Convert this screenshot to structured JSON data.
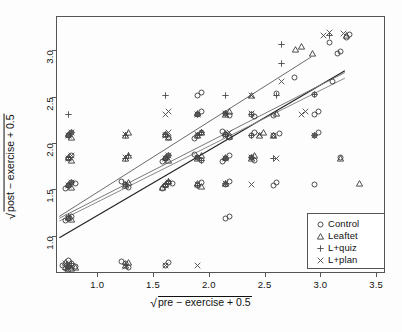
{
  "chart_data": {
    "type": "scatter",
    "title": "",
    "xlabel": "√pre − exercise + 0.5",
    "ylabel": "√post − exercise + 0.5",
    "xlim": [
      0.63,
      3.58
    ],
    "ylim": [
      0.6,
      3.37
    ],
    "xticks": [
      1.0,
      1.5,
      2.0,
      2.5,
      3.0,
      3.5
    ],
    "xtick_labels": [
      "1.0",
      "1.5",
      "2.0",
      "2.5",
      "3.0",
      "3.5"
    ],
    "yticks": [
      1.0,
      1.5,
      2.0,
      2.5,
      3.0
    ],
    "ytick_labels": [
      "1.0",
      "1.5",
      "2.0",
      "2.5",
      "3.0"
    ],
    "grid": false,
    "legend_position": "bottom-right",
    "legend": [
      {
        "label": "Control",
        "marker": "circle-marker",
        "glyph": "○"
      },
      {
        "label": "Leaftet",
        "marker": "triangle-marker",
        "glyph": "△"
      },
      {
        "label": "L+quiz",
        "marker": "plus-marker",
        "glyph": "+"
      },
      {
        "label": "L+plan",
        "marker": "cross-marker",
        "glyph": "×"
      }
    ],
    "series": [
      {
        "name": "Control",
        "marker": "circle-marker",
        "points": [
          [
            0.71,
            0.71
          ],
          [
            0.74,
            0.74
          ],
          [
            0.68,
            0.69
          ],
          [
            0.71,
            0.77
          ],
          [
            0.77,
            0.71
          ],
          [
            0.71,
            0.68
          ],
          [
            0.66,
            0.72
          ],
          [
            1.22,
            0.74
          ],
          [
            1.25,
            0.7
          ],
          [
            1.19,
            0.76
          ],
          [
            1.58,
            0.72
          ],
          [
            1.61,
            0.75
          ],
          [
            0.71,
            1.23
          ],
          [
            0.74,
            1.25
          ],
          [
            0.68,
            1.2
          ],
          [
            0.71,
            1.58
          ],
          [
            0.74,
            1.61
          ],
          [
            0.68,
            1.55
          ],
          [
            0.77,
            1.6
          ],
          [
            1.22,
            1.59
          ],
          [
            1.25,
            1.56
          ],
          [
            1.19,
            1.62
          ],
          [
            1.58,
            1.58
          ],
          [
            1.61,
            1.61
          ],
          [
            1.55,
            1.55
          ],
          [
            1.64,
            1.6
          ],
          [
            1.87,
            1.58
          ],
          [
            1.9,
            1.61
          ],
          [
            2.12,
            1.59
          ],
          [
            2.15,
            1.62
          ],
          [
            0.71,
            1.87
          ],
          [
            0.74,
            1.9
          ],
          [
            1.58,
            1.87
          ],
          [
            1.61,
            1.9
          ],
          [
            1.55,
            1.84
          ],
          [
            1.87,
            1.88
          ],
          [
            1.9,
            1.85
          ],
          [
            1.84,
            1.91
          ],
          [
            2.12,
            1.87
          ],
          [
            2.15,
            1.9
          ],
          [
            2.09,
            1.84
          ],
          [
            2.35,
            1.88
          ],
          [
            2.38,
            1.85
          ],
          [
            0.71,
            2.12
          ],
          [
            0.74,
            2.15
          ],
          [
            1.58,
            2.13
          ],
          [
            1.61,
            2.1
          ],
          [
            1.87,
            2.12
          ],
          [
            1.9,
            2.15
          ],
          [
            1.84,
            2.09
          ],
          [
            2.12,
            2.13
          ],
          [
            2.15,
            2.1
          ],
          [
            2.09,
            2.16
          ],
          [
            2.35,
            2.12
          ],
          [
            2.38,
            2.15
          ],
          [
            2.55,
            2.12
          ],
          [
            2.6,
            2.14
          ],
          [
            2.92,
            2.12
          ],
          [
            2.95,
            2.15
          ],
          [
            1.87,
            2.35
          ],
          [
            1.9,
            2.38
          ],
          [
            2.12,
            2.36
          ],
          [
            2.15,
            2.33
          ],
          [
            2.35,
            2.35
          ],
          [
            2.38,
            2.32
          ],
          [
            2.55,
            2.34
          ],
          [
            2.92,
            2.35
          ],
          [
            2.95,
            2.38
          ],
          [
            1.87,
            2.55
          ],
          [
            1.9,
            2.58
          ],
          [
            2.58,
            2.57
          ],
          [
            2.92,
            2.56
          ],
          [
            3.08,
            2.7
          ],
          [
            2.74,
            2.74
          ],
          [
            3.12,
            3.0
          ],
          [
            3.15,
            3.03
          ],
          [
            3.2,
            3.18
          ],
          [
            3.23,
            3.21
          ],
          [
            3.05,
            3.12
          ],
          [
            2.55,
            1.58
          ],
          [
            2.58,
            1.61
          ],
          [
            2.92,
            1.59
          ],
          [
            3.15,
            1.88
          ],
          [
            2.12,
            1.23
          ],
          [
            2.15,
            1.25
          ]
        ]
      },
      {
        "name": "Leaftet",
        "marker": "triangle-marker",
        "points": [
          [
            0.71,
            0.72
          ],
          [
            0.74,
            0.69
          ],
          [
            0.68,
            0.75
          ],
          [
            0.77,
            0.7
          ],
          [
            1.22,
            0.72
          ],
          [
            1.25,
            0.75
          ],
          [
            0.71,
            1.24
          ],
          [
            0.74,
            1.21
          ],
          [
            1.22,
            1.58
          ],
          [
            1.25,
            1.61
          ],
          [
            0.71,
            1.59
          ],
          [
            0.74,
            1.56
          ],
          [
            1.58,
            1.59
          ],
          [
            1.61,
            1.62
          ],
          [
            1.55,
            1.56
          ],
          [
            1.87,
            1.6
          ],
          [
            1.9,
            1.57
          ],
          [
            2.12,
            1.6
          ],
          [
            0.71,
            1.88
          ],
          [
            0.74,
            1.85
          ],
          [
            1.22,
            1.87
          ],
          [
            1.25,
            1.9
          ],
          [
            1.58,
            1.88
          ],
          [
            1.61,
            1.85
          ],
          [
            1.87,
            1.87
          ],
          [
            1.9,
            1.9
          ],
          [
            2.12,
            1.88
          ],
          [
            2.35,
            1.87
          ],
          [
            2.38,
            1.9
          ],
          [
            0.71,
            2.13
          ],
          [
            0.74,
            2.1
          ],
          [
            1.22,
            2.12
          ],
          [
            1.25,
            2.15
          ],
          [
            1.58,
            2.13
          ],
          [
            1.61,
            2.1
          ],
          [
            1.87,
            2.12
          ],
          [
            1.9,
            2.15
          ],
          [
            2.12,
            2.14
          ],
          [
            2.15,
            2.11
          ],
          [
            2.42,
            2.12
          ],
          [
            2.46,
            2.15
          ],
          [
            3.15,
            1.87
          ],
          [
            3.32,
            1.6
          ],
          [
            1.87,
            2.36
          ],
          [
            2.12,
            2.35
          ],
          [
            2.15,
            2.38
          ],
          [
            2.58,
            2.36
          ],
          [
            2.75,
            3.05
          ],
          [
            2.8,
            3.08
          ],
          [
            2.9,
            3.0
          ],
          [
            3.2,
            3.2
          ],
          [
            2.35,
            2.55
          ],
          [
            2.55,
            2.12
          ]
        ]
      },
      {
        "name": "L+quiz",
        "marker": "plus-marker",
        "points": [
          [
            0.71,
            0.71
          ],
          [
            0.74,
            0.74
          ],
          [
            0.68,
            0.68
          ],
          [
            1.22,
            0.73
          ],
          [
            0.71,
            1.25
          ],
          [
            0.71,
            1.58
          ],
          [
            0.74,
            1.61
          ],
          [
            1.22,
            1.59
          ],
          [
            1.58,
            1.59
          ],
          [
            1.61,
            1.62
          ],
          [
            1.87,
            1.58
          ],
          [
            2.12,
            1.6
          ],
          [
            0.71,
            1.88
          ],
          [
            1.22,
            1.87
          ],
          [
            1.25,
            1.9
          ],
          [
            1.58,
            1.87
          ],
          [
            1.61,
            1.9
          ],
          [
            1.87,
            1.88
          ],
          [
            1.9,
            1.85
          ],
          [
            2.12,
            1.87
          ],
          [
            2.35,
            1.88
          ],
          [
            0.71,
            2.12
          ],
          [
            0.74,
            2.15
          ],
          [
            1.22,
            2.12
          ],
          [
            1.58,
            2.13
          ],
          [
            1.87,
            2.12
          ],
          [
            1.9,
            2.15
          ],
          [
            2.12,
            2.13
          ],
          [
            2.35,
            2.12
          ],
          [
            0.71,
            2.35
          ],
          [
            1.87,
            2.35
          ],
          [
            2.12,
            2.36
          ],
          [
            2.35,
            2.35
          ],
          [
            1.58,
            2.55
          ],
          [
            2.58,
            2.55
          ],
          [
            2.92,
            2.56
          ],
          [
            2.62,
            3.1
          ],
          [
            2.62,
            2.9
          ],
          [
            3.05,
            3.2
          ],
          [
            2.92,
            2.12
          ],
          [
            2.55,
            1.87
          ],
          [
            2.12,
            2.55
          ]
        ]
      },
      {
        "name": "L+plan",
        "marker": "cross-marker",
        "points": [
          [
            0.71,
            0.72
          ],
          [
            0.74,
            0.7
          ],
          [
            0.68,
            0.74
          ],
          [
            1.22,
            0.71
          ],
          [
            1.58,
            0.72
          ],
          [
            1.87,
            0.72
          ],
          [
            0.71,
            1.24
          ],
          [
            0.71,
            1.58
          ],
          [
            0.74,
            1.61
          ],
          [
            1.22,
            1.6
          ],
          [
            1.58,
            1.58
          ],
          [
            1.61,
            1.61
          ],
          [
            1.87,
            1.59
          ],
          [
            2.12,
            1.6
          ],
          [
            2.35,
            1.59
          ],
          [
            0.71,
            1.87
          ],
          [
            0.74,
            1.9
          ],
          [
            1.22,
            1.88
          ],
          [
            1.58,
            1.87
          ],
          [
            1.61,
            1.9
          ],
          [
            1.87,
            1.88
          ],
          [
            2.12,
            1.87
          ],
          [
            2.35,
            1.88
          ],
          [
            2.58,
            1.87
          ],
          [
            0.71,
            2.12
          ],
          [
            0.74,
            2.15
          ],
          [
            1.22,
            2.13
          ],
          [
            1.58,
            2.12
          ],
          [
            1.61,
            2.15
          ],
          [
            1.87,
            2.13
          ],
          [
            2.12,
            2.12
          ],
          [
            2.15,
            2.15
          ],
          [
            2.42,
            2.13
          ],
          [
            1.58,
            2.35
          ],
          [
            1.61,
            2.38
          ],
          [
            1.87,
            2.35
          ],
          [
            2.12,
            2.36
          ],
          [
            2.35,
            2.36
          ],
          [
            2.8,
            2.35
          ],
          [
            2.84,
            2.38
          ],
          [
            2.62,
            2.7
          ],
          [
            3.0,
            3.2
          ],
          [
            3.05,
            3.23
          ],
          [
            3.18,
            3.22
          ],
          [
            2.35,
            2.55
          ],
          [
            2.92,
            2.12
          ],
          [
            2.55,
            2.12
          ]
        ]
      }
    ],
    "fit_lines": [
      {
        "name": "control-fit",
        "x0": 0.66,
        "y0": 0.98,
        "x1": 3.22,
        "y1": 2.78,
        "color": "#222222",
        "width": 1.2
      },
      {
        "name": "leaftet-fit",
        "x0": 0.66,
        "y0": 1.19,
        "x1": 3.22,
        "y1": 2.76,
        "color": "#7a7a7a",
        "width": 1.0
      },
      {
        "name": "lquiz-fit",
        "x0": 0.66,
        "y0": 1.21,
        "x1": 2.92,
        "y1": 2.93,
        "color": "#6a6a6a",
        "width": 1.0
      },
      {
        "name": "lplan-fit",
        "x0": 0.66,
        "y0": 1.16,
        "x1": 3.22,
        "y1": 2.7,
        "color": "#8a8a8a",
        "width": 1.0
      }
    ]
  }
}
